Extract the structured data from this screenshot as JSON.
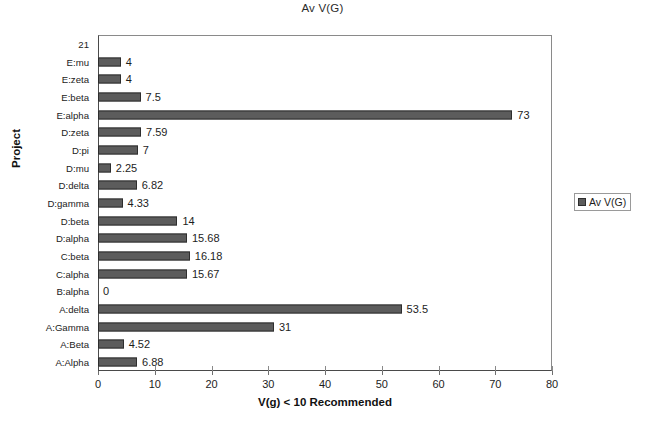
{
  "chart_data": {
    "type": "bar",
    "orientation": "horizontal",
    "title": "Av V(G)",
    "xlabel": "V(g) < 10 Recommended",
    "ylabel": "Project",
    "xlim": [
      0,
      80
    ],
    "xticks": [
      0,
      10,
      20,
      30,
      40,
      50,
      60,
      70,
      80
    ],
    "xtick_labels": [
      "0",
      "10",
      "20",
      "30",
      "40",
      "50",
      "60",
      "70",
      "80"
    ],
    "grid": false,
    "legend": {
      "position": "right",
      "entries": [
        "Av V(G)"
      ]
    },
    "series_name": "Av V(G)",
    "bar_color": "#5c5c5c",
    "bar_border_color": "#2e2e2e",
    "categories": [
      "21",
      "E:mu",
      "E:zeta",
      "E:beta",
      "E:alpha",
      "D:zeta",
      "D:pi",
      "D:mu",
      "D:delta",
      "D:gamma",
      "D:beta",
      "D:alpha",
      "C:beta",
      "C:alpha",
      "B:alpha",
      "A:delta",
      "A:Gamma",
      "A:Beta",
      "A:Alpha"
    ],
    "values": [
      null,
      4,
      4,
      7.5,
      73,
      7.59,
      7,
      2.25,
      6.82,
      4.33,
      14,
      15.68,
      16.18,
      15.67,
      0,
      53.5,
      31,
      4.52,
      6.88
    ],
    "value_labels": [
      "",
      "4",
      "4",
      "7.5",
      "73",
      "7.59",
      "7",
      "2.25",
      "6.82",
      "4.33",
      "14",
      "15.68",
      "16.18",
      "15.67",
      "0",
      "53.5",
      "31",
      "4.52",
      "6.88"
    ]
  }
}
